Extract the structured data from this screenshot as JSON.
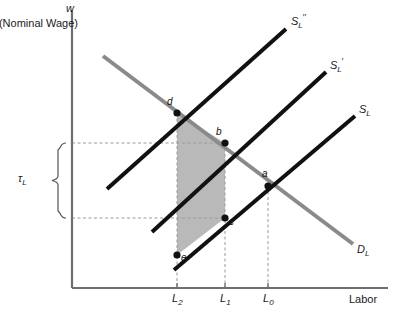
{
  "figure": {
    "width": 393,
    "height": 320,
    "background": "#ffffff"
  },
  "axes": {
    "y_symbol": "w",
    "y_caption": "(Nominal Wage)",
    "x_label": "Labor",
    "axis_color": "#6e6e6e",
    "origin": {
      "x": 72,
      "y": 288
    },
    "x_end": 388,
    "y_top": 10
  },
  "tick_labels": [
    {
      "name": "L2",
      "text": "L",
      "sub": "2",
      "x": 177
    },
    {
      "name": "L1",
      "text": "L",
      "sub": "1",
      "x": 225
    },
    {
      "name": "L0",
      "text": "L",
      "sub": "0",
      "x": 268
    }
  ],
  "bracket": {
    "label": "τ",
    "sub": "L",
    "top": 143,
    "bottom": 218,
    "x": 48
  },
  "curves": [
    {
      "name": "supply-shifted-double",
      "label_base": "S",
      "label_sub": "L",
      "label_sup": "′′",
      "color": "#111111",
      "width": 4,
      "x1": 107,
      "y1": 189,
      "x2": 286,
      "y2": 29,
      "label_x": 291,
      "label_y": 18
    },
    {
      "name": "supply-shifted-single",
      "label_base": "S",
      "label_sub": "L",
      "label_sup": "′",
      "color": "#111111",
      "width": 4,
      "x1": 152,
      "y1": 232,
      "x2": 326,
      "y2": 72,
      "label_x": 330,
      "label_y": 62
    },
    {
      "name": "supply-original",
      "label_base": "S",
      "label_sub": "L",
      "label_sup": "",
      "color": "#111111",
      "width": 4,
      "x1": 174,
      "y1": 270,
      "x2": 355,
      "y2": 116,
      "label_x": 359,
      "label_y": 106
    },
    {
      "name": "demand",
      "label_base": "D",
      "label_sub": "L",
      "label_sup": "",
      "color": "#8a8a8a",
      "width": 4,
      "x1": 103,
      "y1": 56,
      "x2": 353,
      "y2": 244,
      "label_x": 357,
      "label_y": 246
    }
  ],
  "points": [
    {
      "name": "point-d",
      "label": "d",
      "x": 177,
      "y": 113,
      "lx": 167,
      "ly": 96
    },
    {
      "name": "point-b",
      "label": "b",
      "x": 225,
      "y": 143,
      "lx": 216,
      "ly": 126
    },
    {
      "name": "point-a",
      "label": "a",
      "x": 268,
      "y": 186,
      "lx": 262,
      "ly": 169
    },
    {
      "name": "point-c",
      "label": "c",
      "x": 225,
      "y": 218,
      "lx": 229,
      "ly": 219
    },
    {
      "name": "point-e",
      "label": "e",
      "x": 177,
      "y": 255,
      "lx": 181,
      "ly": 255
    }
  ],
  "shaded_region": {
    "name": "tax-wedge-region",
    "fill": "#b9b9b9",
    "vertices": "177,113 225,143 225,218 177,255"
  },
  "guide_lines": {
    "color": "#9a9a9a",
    "horizontals": [
      {
        "name": "guide-b-level",
        "y": 143,
        "x1": 72,
        "x2": 225
      },
      {
        "name": "guide-c-level",
        "y": 218,
        "x1": 72,
        "x2": 225
      }
    ],
    "verticals": [
      {
        "name": "guide-L2",
        "x": 177,
        "y1": 113,
        "y2": 288
      },
      {
        "name": "guide-L1",
        "x": 225,
        "y1": 143,
        "y2": 288
      },
      {
        "name": "guide-L0",
        "x": 268,
        "y1": 186,
        "y2": 288
      }
    ]
  }
}
